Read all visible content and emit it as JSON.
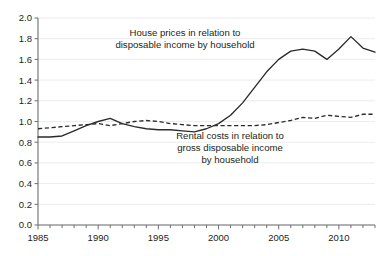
{
  "chart_data": {
    "type": "line",
    "title": "",
    "subtitle": "",
    "xlabel": "",
    "ylabel": "",
    "xlim": [
      1985,
      2013
    ],
    "ylim": [
      0.0,
      2.0
    ],
    "grid": true,
    "legend_position": "inline-annotations",
    "x": [
      1985,
      1986,
      1987,
      1988,
      1989,
      1990,
      1991,
      1992,
      1993,
      1994,
      1995,
      1996,
      1997,
      1998,
      1999,
      2000,
      2001,
      2002,
      2003,
      2004,
      2005,
      2006,
      2007,
      2008,
      2009,
      2010,
      2011,
      2012,
      2013
    ],
    "ytick_labels": [
      "0.0",
      "0.2",
      "0.4",
      "0.6",
      "0.8",
      "1.0",
      "1.2",
      "1.4",
      "1.6",
      "1.8",
      "2.0"
    ],
    "ytick_values": [
      0.0,
      0.2,
      0.4,
      0.6,
      0.8,
      1.0,
      1.2,
      1.4,
      1.6,
      1.8,
      2.0
    ],
    "xtick_labels": [
      "1985",
      "1990",
      "1995",
      "2000",
      "2005",
      "2010"
    ],
    "xtick_values": [
      1985,
      1990,
      1995,
      2000,
      2005,
      2010
    ],
    "series": [
      {
        "name": "House prices in relation to disposable income by household",
        "style": "solid",
        "color": "#2b2b2b",
        "values": [
          0.85,
          0.85,
          0.86,
          0.91,
          0.96,
          1.0,
          1.03,
          0.98,
          0.95,
          0.93,
          0.92,
          0.92,
          0.91,
          0.9,
          0.93,
          0.98,
          1.06,
          1.18,
          1.33,
          1.48,
          1.6,
          1.68,
          1.7,
          1.68,
          1.6,
          1.7,
          1.82,
          1.71,
          1.67
        ]
      },
      {
        "name": "Rental costs in relation to gross disposable income by household",
        "style": "dashed",
        "color": "#2b2b2b",
        "values": [
          0.93,
          0.94,
          0.95,
          0.96,
          0.97,
          0.98,
          0.96,
          0.98,
          1.0,
          1.01,
          1.0,
          0.98,
          0.97,
          0.96,
          0.96,
          0.96,
          0.96,
          0.96,
          0.96,
          0.97,
          0.99,
          1.01,
          1.04,
          1.03,
          1.06,
          1.05,
          1.04,
          1.07,
          1.07
        ]
      }
    ],
    "annotations": [
      {
        "id": "house-prices-label",
        "lines": [
          "House prices in relation to",
          "disposable income by household"
        ],
        "x_px": 185,
        "y_px": 36
      },
      {
        "id": "rental-costs-label",
        "lines": [
          "Rental costs in relation to",
          "gross disposable income",
          "by household"
        ],
        "x_px": 230,
        "y_px": 139
      }
    ],
    "colors": {
      "background": "#ffffff",
      "gridline": "#ececec",
      "axis": "#6d6e71",
      "text": "#231f20",
      "line": "#2b2b2b"
    }
  }
}
